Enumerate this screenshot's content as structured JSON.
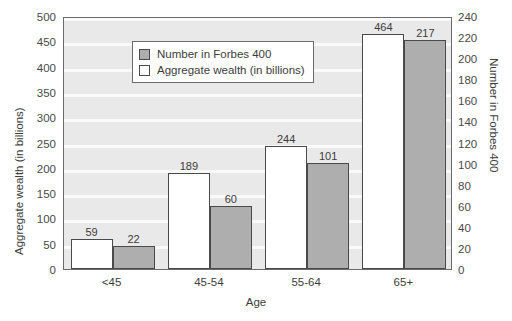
{
  "chart_data": {
    "type": "bar",
    "title": "",
    "xlabel": "Age",
    "ylabel": "Aggregate wealth (in billions)",
    "ylabel_right": "Number in Forbes 400",
    "categories": [
      "<45",
      "45-54",
      "55-64",
      "65+"
    ],
    "series": [
      {
        "name": "Aggregate wealth (in billions)",
        "axis": "left",
        "color": "#ffffff",
        "values": [
          59,
          189,
          244,
          464
        ]
      },
      {
        "name": "Number in Forbes 400",
        "axis": "right",
        "color": "#aeaeae",
        "values": [
          22,
          60,
          101,
          217
        ]
      }
    ],
    "ylim": [
      0,
      500
    ],
    "ylim_right": [
      0,
      240
    ],
    "yticks": [
      0,
      50,
      100,
      150,
      200,
      250,
      300,
      350,
      400,
      450,
      500
    ],
    "yticks_right": [
      0,
      20,
      40,
      60,
      80,
      100,
      120,
      140,
      160,
      180,
      200,
      220,
      240
    ],
    "grid": true,
    "legend_position": "top-left",
    "bar_value_labels": true
  },
  "legend": {
    "items": [
      {
        "label": "Number in Forbes 400",
        "swatch": "count"
      },
      {
        "label": "Aggregate wealth (in billions)",
        "swatch": "wealth"
      }
    ]
  },
  "colors": {
    "plot_background": "#e9e9e9",
    "gridline": "#fafafa",
    "bar_count": "#aeaeae",
    "bar_wealth": "#ffffff",
    "border": "#6b6b6b",
    "text": "#3c3c3c"
  }
}
